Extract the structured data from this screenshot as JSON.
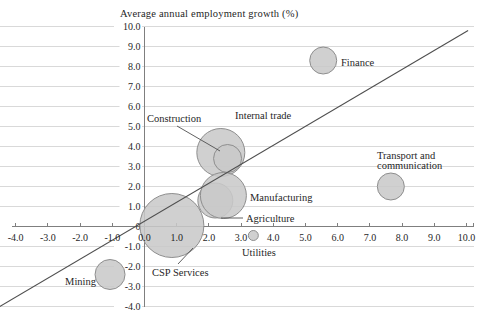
{
  "chart_data": {
    "type": "scatter",
    "subtype": "bubble",
    "title": "Average annual employment growth (%)",
    "x_axis": {
      "min": -4,
      "max": 10,
      "step": 1,
      "tick_labels": [
        "-4.0",
        "-3.0",
        "-2.0",
        "-1.0",
        "0.0",
        "1.0",
        "2.0",
        "3.0",
        "4.0",
        "5.0",
        "6.0",
        "7.0",
        "8.0",
        "9.0",
        "10.0"
      ],
      "tick_values": [
        -4,
        -3,
        -2,
        -1,
        0,
        1,
        2,
        3,
        4,
        5,
        6,
        7,
        8,
        9,
        10
      ]
    },
    "y_axis": {
      "min": -4,
      "max": 10,
      "step": 1,
      "tick_labels": [
        "10.0",
        "9.0",
        "8.0",
        "7.0",
        "6.0",
        "5.0",
        "4.0",
        "3.0",
        "2.0",
        "1.0",
        "0",
        "-1.0",
        "-2.0",
        "-3.0",
        "-4.0"
      ],
      "tick_values": [
        10,
        9,
        8,
        7,
        6,
        5,
        4,
        3,
        2,
        1,
        0,
        -1,
        -2,
        -3,
        -4
      ]
    },
    "grid": {
      "horizontal": true,
      "vertical": false
    },
    "legend": "none",
    "trend_line": {
      "x1": -4.5,
      "y1": -4.0,
      "x2": 10.05,
      "y2": 9.8
    },
    "series": [
      {
        "name": "internal-trade",
        "label": [
          "Internal trade"
        ],
        "x": 2.37,
        "y": 3.7,
        "r_px": 24,
        "label_px": [
          235,
          115
        ],
        "align": "start"
      },
      {
        "name": "construction",
        "label": [
          "Construction"
        ],
        "x": 2.58,
        "y": 3.4,
        "r_px": 14,
        "label_px": [
          147,
          118
        ],
        "align": "start",
        "leader": [
          177,
          126,
          220,
          151
        ]
      },
      {
        "name": "agriculture",
        "label": [
          "Agriculture"
        ],
        "x": 2.2,
        "y": 1.3,
        "r_px": 17.5,
        "label_px": [
          246,
          218
        ],
        "align": "start",
        "leader": [
          243,
          218,
          221,
          218
        ]
      },
      {
        "name": "manufacturing",
        "label": [
          "Manufacturing"
        ],
        "x": 2.45,
        "y": 1.55,
        "r_px": 23,
        "label_px": [
          250,
          197
        ],
        "align": "start"
      },
      {
        "name": "csp-services",
        "label": [
          "CSP Services"
        ],
        "x": 0.85,
        "y": 0.05,
        "r_px": 32,
        "label_px": [
          152,
          272
        ],
        "align": "start",
        "leader": [
          178,
          264,
          193,
          248
        ]
      },
      {
        "name": "mining",
        "label": [
          "Mining"
        ],
        "x": -1.07,
        "y": -2.4,
        "r_px": 15,
        "label_px": [
          96,
          281
        ],
        "align": "end"
      },
      {
        "name": "utilities",
        "label": [
          "Utilities"
        ],
        "x": 3.38,
        "y": -0.45,
        "r_px": 5,
        "label_px": [
          242,
          252
        ],
        "align": "start"
      },
      {
        "name": "finance",
        "label": [
          "Finance"
        ],
        "x": 5.55,
        "y": 8.3,
        "r_px": 13.5,
        "label_px": [
          341,
          62
        ],
        "align": "start"
      },
      {
        "name": "transport-communication",
        "label": [
          "Transport and",
          "communication"
        ],
        "x": 7.65,
        "y": 2.0,
        "r_px": 13.5,
        "label_px": [
          377,
          155
        ],
        "align": "start"
      }
    ],
    "colors": {
      "bubble_fill": "#c9c9c9",
      "bubble_stroke": "#8e8e8e",
      "gridline": "#d9d9d9",
      "axis": "#7f7f7f",
      "trend_line": "#4f4f4f",
      "text": "#1f1f1f",
      "background": "#ffffff"
    }
  }
}
